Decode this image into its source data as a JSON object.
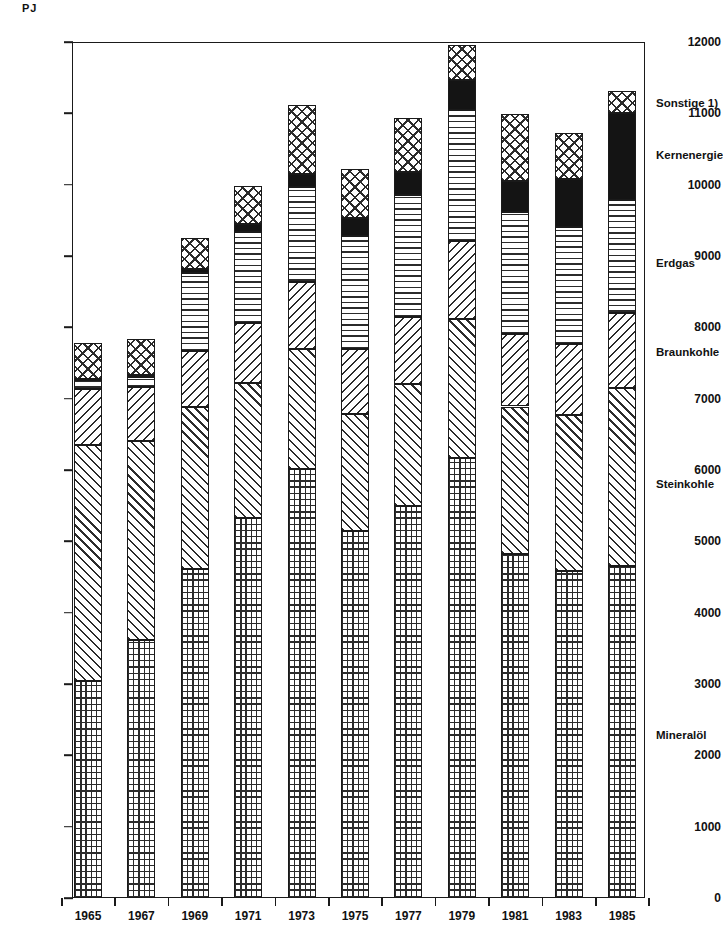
{
  "chart_data": {
    "type": "bar",
    "subtype": "stacked-bar",
    "title": "",
    "xlabel": "",
    "ylabel": "PJ",
    "unit": "PJ",
    "ylim": [
      0,
      12000
    ],
    "yticks": [
      0,
      1000,
      2000,
      3000,
      4000,
      5000,
      6000,
      7000,
      8000,
      9000,
      10000,
      11000,
      12000
    ],
    "ytick_labels": [
      "0",
      "1000",
      "2000",
      "3000",
      "4000",
      "5000",
      "6000",
      "7000",
      "8000",
      "9000",
      "10000",
      "11000",
      "12000"
    ],
    "grid": false,
    "legend_position": "right",
    "categories": [
      "1965",
      "1967",
      "1969",
      "1971",
      "1973",
      "1975",
      "1977",
      "1979",
      "1981",
      "1983",
      "1985"
    ],
    "series": [
      {
        "name": "Mineralöl",
        "pattern": "grid",
        "values": [
          3040,
          3620,
          4610,
          5330,
          6020,
          5150,
          5500,
          6170,
          4820,
          4580,
          4650
        ]
      },
      {
        "name": "Steinkohle",
        "pattern": "diagonal-up",
        "values": [
          3310,
          2790,
          2270,
          1890,
          1680,
          1640,
          1700,
          1950,
          2070,
          2190,
          2500
        ]
      },
      {
        "name": "Braunkohle",
        "pattern": "diagonal-down",
        "values": [
          790,
          760,
          790,
          840,
          930,
          900,
          950,
          1090,
          1010,
          1000,
          1050
        ]
      },
      {
        "name": "Erdgas",
        "pattern": "horizontal-lines",
        "values": [
          120,
          130,
          1090,
          1270,
          1340,
          1590,
          1700,
          1840,
          1720,
          1640,
          1580
        ]
      },
      {
        "name": "Kernenergie",
        "pattern": "solid-black",
        "values": [
          20,
          30,
          60,
          120,
          180,
          250,
          330,
          420,
          430,
          670,
          1220
        ]
      },
      {
        "name": "Sonstige 1)",
        "pattern": "cross-hatch",
        "values": [
          500,
          500,
          430,
          530,
          960,
          690,
          760,
          490,
          940,
          650,
          320
        ]
      }
    ],
    "totals": [
      7780,
      7830,
      9250,
      9980,
      11110,
      10220,
      10940,
      11960,
      10990,
      10730,
      11320
    ]
  },
  "legend": {
    "items": [
      {
        "label": "Sonstige 1)",
        "y": 103
      },
      {
        "label": "Kernenergie",
        "y": 155
      },
      {
        "label": "Erdgas",
        "y": 263
      },
      {
        "label": "Braunkohle",
        "y": 352
      },
      {
        "label": "Steinkohle",
        "y": 484
      },
      {
        "label": "Mineralöl",
        "y": 735
      }
    ]
  },
  "axis": {
    "unit_label": "PJ"
  },
  "colors": {
    "ink": "#1a1a1a",
    "hatch": "#2b2b2b",
    "solid": "#141414",
    "background": "#ffffff"
  }
}
